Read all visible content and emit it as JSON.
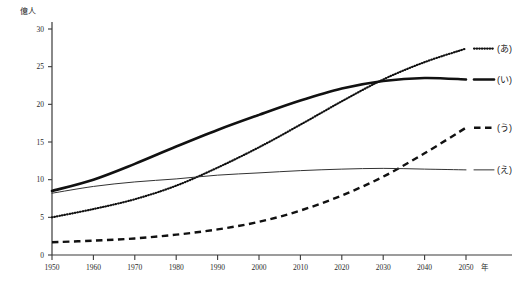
{
  "chart_data": {
    "type": "line",
    "title": "",
    "xlabel": "年",
    "ylabel": "億人",
    "xlim": [
      1950,
      2050
    ],
    "ylim": [
      0,
      30
    ],
    "ytick_labels": [
      "0",
      "5",
      "10",
      "15",
      "20",
      "25",
      "30"
    ],
    "yticks": [
      0,
      5,
      10,
      15,
      20,
      25,
      30
    ],
    "xtick_labels": [
      "1950",
      "1960",
      "1970",
      "1980",
      "1990",
      "2000",
      "2010",
      "2020",
      "2030",
      "2040",
      "2050"
    ],
    "xticks": [
      1950,
      1960,
      1970,
      1980,
      1990,
      2000,
      2010,
      2020,
      2030,
      2040,
      2050
    ],
    "grid": false,
    "legend_position": "right",
    "x": [
      1950,
      1960,
      1970,
      1980,
      1990,
      2000,
      2010,
      2020,
      2030,
      2040,
      2050
    ],
    "series": [
      {
        "name": "(あ)",
        "style": "dotted",
        "values": [
          5.0,
          6.1,
          7.4,
          9.2,
          11.6,
          14.3,
          17.3,
          20.4,
          23.3,
          25.6,
          27.4
        ]
      },
      {
        "name": "(い)",
        "style": "thick-solid",
        "values": [
          8.5,
          10.0,
          12.1,
          14.4,
          16.6,
          18.6,
          20.5,
          22.1,
          23.1,
          23.5,
          23.3
        ]
      },
      {
        "name": "(う)",
        "style": "dashed",
        "values": [
          1.7,
          1.9,
          2.2,
          2.7,
          3.4,
          4.4,
          5.9,
          7.9,
          10.4,
          13.5,
          16.9
        ]
      },
      {
        "name": "(え)",
        "style": "thin-solid",
        "values": [
          8.2,
          9.1,
          9.7,
          10.1,
          10.6,
          10.9,
          11.2,
          11.4,
          11.5,
          11.4,
          11.3
        ]
      }
    ]
  },
  "axis": {
    "unit_y": "億人",
    "unit_x": "年"
  },
  "legend": {
    "items": [
      {
        "label": "(あ)"
      },
      {
        "label": "(い)"
      },
      {
        "label": "(う)"
      },
      {
        "label": "(え)"
      }
    ]
  }
}
